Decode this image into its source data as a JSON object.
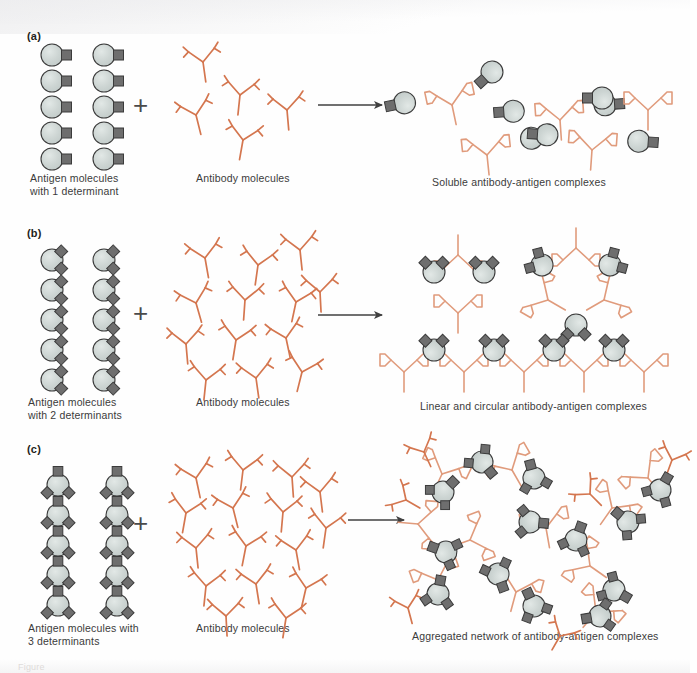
{
  "figure": {
    "background_color": "#fefefe"
  },
  "colors": {
    "antigen_fill": "#ccd4d2",
    "antigen_stroke": "#3b3b3b",
    "determinant_fill": "#6e6e6e",
    "determinant_stroke": "#3b3b3b",
    "antibody_stroke": "#d4764f",
    "arrow_color": "#404040",
    "text_color": "#3b3b3b",
    "panel_label_color": "#231f20"
  },
  "panels": [
    {
      "id": "a",
      "label": "(a)",
      "antigen_caption": "Antigen molecules\nwith 1 determinant",
      "antigen_determinants": 1,
      "antigen_count": 10,
      "plus_symbol": "+",
      "antibody_caption": "Antibody molecules",
      "antibody_count": 5,
      "arrow_symbol": "arrow-right",
      "product_caption": "Soluble antibody-antigen complexes",
      "product_description": "Small soluble complexes of one antibody bound to one or two monovalent antigens"
    },
    {
      "id": "b",
      "label": "(b)",
      "antigen_caption": "Antigen molecules\nwith 2 determinants",
      "antigen_determinants": 2,
      "antigen_count": 10,
      "plus_symbol": "+",
      "antibody_caption": "Antibody molecules",
      "antibody_count": 13,
      "arrow_symbol": "arrow-right",
      "product_caption": "Linear and circular antibody-antigen complexes",
      "product_description": "Closed rings and extended linear lattices of alternating antigen and antibody"
    },
    {
      "id": "c",
      "label": "(c)",
      "antigen_caption": "Antigen molecules with\n3 determinants",
      "antigen_determinants": 3,
      "antigen_count": 10,
      "plus_symbol": "+",
      "antibody_caption": "Antibody molecules",
      "antibody_count": 16,
      "arrow_symbol": "arrow-right",
      "product_caption": "Aggregated network of antibody-antigen complexes",
      "product_description": "Large cross-linked three-dimensional precipitating lattice"
    }
  ],
  "legend_shapes": {
    "antigen": "gray-circle",
    "determinant_square": "dark-square",
    "determinant_diamond": "dark-diamond",
    "antibody": "orange-y-shape",
    "arrow": "right-arrow",
    "plus": "plus-sign"
  },
  "footer": {
    "caption_fragment": "Figure"
  }
}
